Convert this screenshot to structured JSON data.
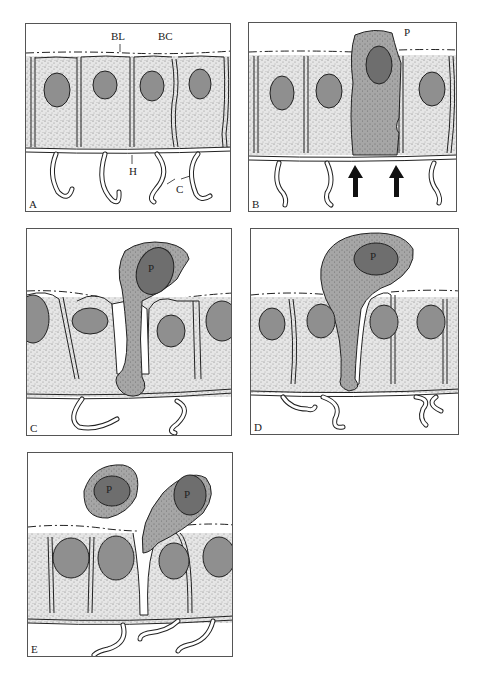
{
  "figure": {
    "colors": {
      "cytoplasm_stipple": "#e4e4e4",
      "stipple_dot": "#6a6a6a",
      "epithelial_nucleus": "#8f8f8f",
      "phagocyte_body": "#a9a9a9",
      "phagocyte_nucleus": "#6e6e6e",
      "outline": "#222222",
      "arrow": "#111111"
    },
    "panels": [
      {
        "id": "A",
        "letter": "A",
        "labels": [
          {
            "text": "BL",
            "meaning": "basal lamina"
          },
          {
            "text": "BC",
            "meaning": "body cavity"
          },
          {
            "text": "H",
            "meaning": "hemidesmosome / basal region"
          },
          {
            "text": "C",
            "meaning": "cell processes"
          }
        ]
      },
      {
        "id": "B",
        "letter": "B",
        "labels": [
          {
            "text": "P",
            "meaning": "phagocyte"
          }
        ],
        "arrows": 2
      },
      {
        "id": "C",
        "letter": "C",
        "labels": [
          {
            "text": "P",
            "meaning": "phagocyte"
          }
        ]
      },
      {
        "id": "D",
        "letter": "D",
        "labels": [
          {
            "text": "P",
            "meaning": "phagocyte"
          }
        ]
      },
      {
        "id": "E",
        "letter": "E",
        "labels": [
          {
            "text": "P",
            "meaning": "phagocyte (free)"
          },
          {
            "text": "P",
            "meaning": "phagocyte (exiting)"
          }
        ]
      }
    ]
  }
}
